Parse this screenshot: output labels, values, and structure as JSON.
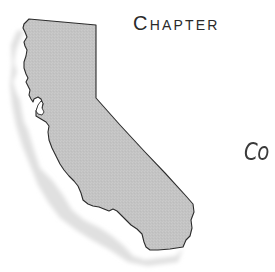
{
  "page": {
    "chapter_heading": "Chapter",
    "subtitle_fragment": "Co"
  },
  "illustration": {
    "subject": "california-state-map",
    "fill_color": "#c4c4c4",
    "outline_color": "#2b2b2b",
    "shadow_color": "#e2e2e2",
    "background_color": "#ffffff"
  }
}
